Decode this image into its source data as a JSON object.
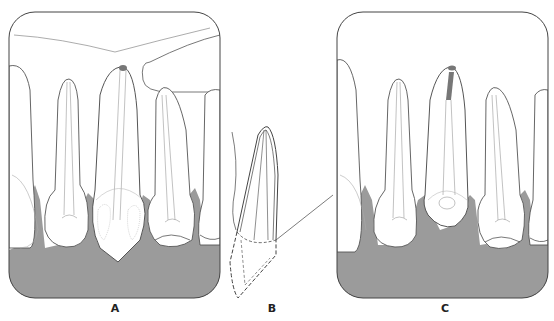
{
  "figure": {
    "panels": [
      {
        "id": "A",
        "label": "A",
        "description": "Maxillary anterior teeth with crowns and roots; central incisor with open apex spot and mottled crown"
      },
      {
        "id": "B",
        "label": "B",
        "description": "Lateral view of tooth root with dashed outline of crown position"
      },
      {
        "id": "C",
        "label": "C",
        "description": "Maxillary anterior teeth with root canal filling in central incisor apex region"
      }
    ],
    "colors": {
      "gingiva_fill": "#9b9b9b",
      "outline": "#555555",
      "tooth_fill": "#ffffff",
      "filling": "#8a8a8a"
    }
  }
}
